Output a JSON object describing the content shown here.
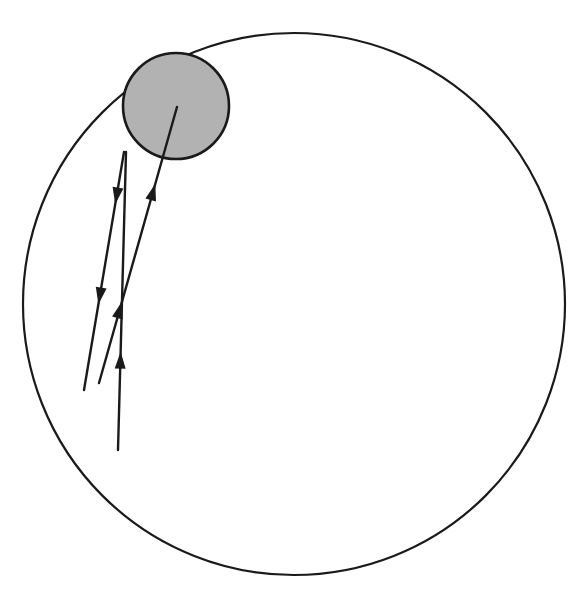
{
  "figure": {
    "title": "Orbital trajectory diagram",
    "background_color": "#ffffff",
    "canvas": {
      "width": 578,
      "height": 593
    }
  },
  "style": {
    "stroke_color": "#1a1a1a",
    "shaded_fill": "#b2b2b2",
    "outer_circle_stroke_width": 2.2,
    "shaded_circle_stroke_width": 2.6,
    "trajectory_stroke_width": 2.4
  },
  "shapes": {
    "outer_circle": {
      "name": "outer-boundary-circle",
      "cx": 294,
      "cy": 304,
      "r": 271,
      "fill": "none"
    },
    "shaded_circle": {
      "name": "shaded-disk",
      "cx": 176,
      "cy": 106,
      "r": 53,
      "fill": "#b2b2b2"
    }
  },
  "trajectories": [
    {
      "id": "path-into-disk",
      "name": "trajectory-into-disk",
      "x1": 99,
      "y1": 383,
      "x2": 177,
      "y2": 107,
      "arrows": [
        {
          "t": 0.295,
          "direction": "up"
        },
        {
          "t": 0.722,
          "direction": "up"
        }
      ]
    },
    {
      "id": "path-left-outbound",
      "name": "trajectory-left-outbound",
      "x1": 124,
      "y1": 152,
      "x2": 84,
      "y2": 390,
      "arrows": [
        {
          "t": 0.22,
          "direction": "down"
        },
        {
          "t": 0.64,
          "direction": "down"
        }
      ]
    },
    {
      "id": "path-near-vertical",
      "name": "trajectory-near-vertical",
      "x1": 118,
      "y1": 450,
      "x2": 126,
      "y2": 152,
      "arrows": [
        {
          "t": 0.33,
          "direction": "up"
        }
      ]
    }
  ],
  "arrowhead": {
    "name": "arrowhead-marker",
    "length": 17,
    "half_width": 5.5
  }
}
